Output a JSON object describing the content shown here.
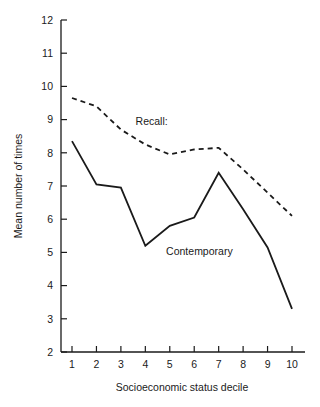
{
  "chart_data": {
    "type": "line",
    "title": "",
    "subtitle": "",
    "xlabel": "Socioeconomic status decile",
    "ylabel": "Mean number of times",
    "x": [
      1,
      2,
      3,
      4,
      5,
      6,
      7,
      8,
      9,
      10
    ],
    "xtick_labels": [
      "1",
      "2",
      "3",
      "4",
      "5",
      "6",
      "7",
      "8",
      "9",
      "10"
    ],
    "ytick_labels": [
      "12",
      "11",
      "10",
      "9",
      "8",
      "7",
      "6",
      "5",
      "4",
      "3",
      "2"
    ],
    "yticks": [
      12,
      11,
      10,
      9,
      8,
      7,
      6,
      5,
      4,
      3,
      2
    ],
    "xlim": [
      0.45,
      10.55
    ],
    "ylim": [
      2,
      12
    ],
    "grid": false,
    "legend_position": "inline-annotation",
    "series": [
      {
        "name": "Recall:",
        "style": "dashed",
        "color": "#1a1a1a",
        "values": [
          9.65,
          9.4,
          8.7,
          8.25,
          7.95,
          8.1,
          8.15,
          7.5,
          6.8,
          6.1
        ]
      },
      {
        "name": "Contemporary",
        "style": "solid",
        "color": "#1a1a1a",
        "values": [
          8.35,
          7.05,
          6.95,
          5.2,
          5.8,
          6.05,
          7.4,
          6.3,
          5.15,
          3.3
        ]
      }
    ],
    "annotations": [
      {
        "text": "Recall:",
        "x": 3.6,
        "y": 8.95
      },
      {
        "text": "Contemporary",
        "x": 4.85,
        "y": 5.05
      }
    ]
  }
}
